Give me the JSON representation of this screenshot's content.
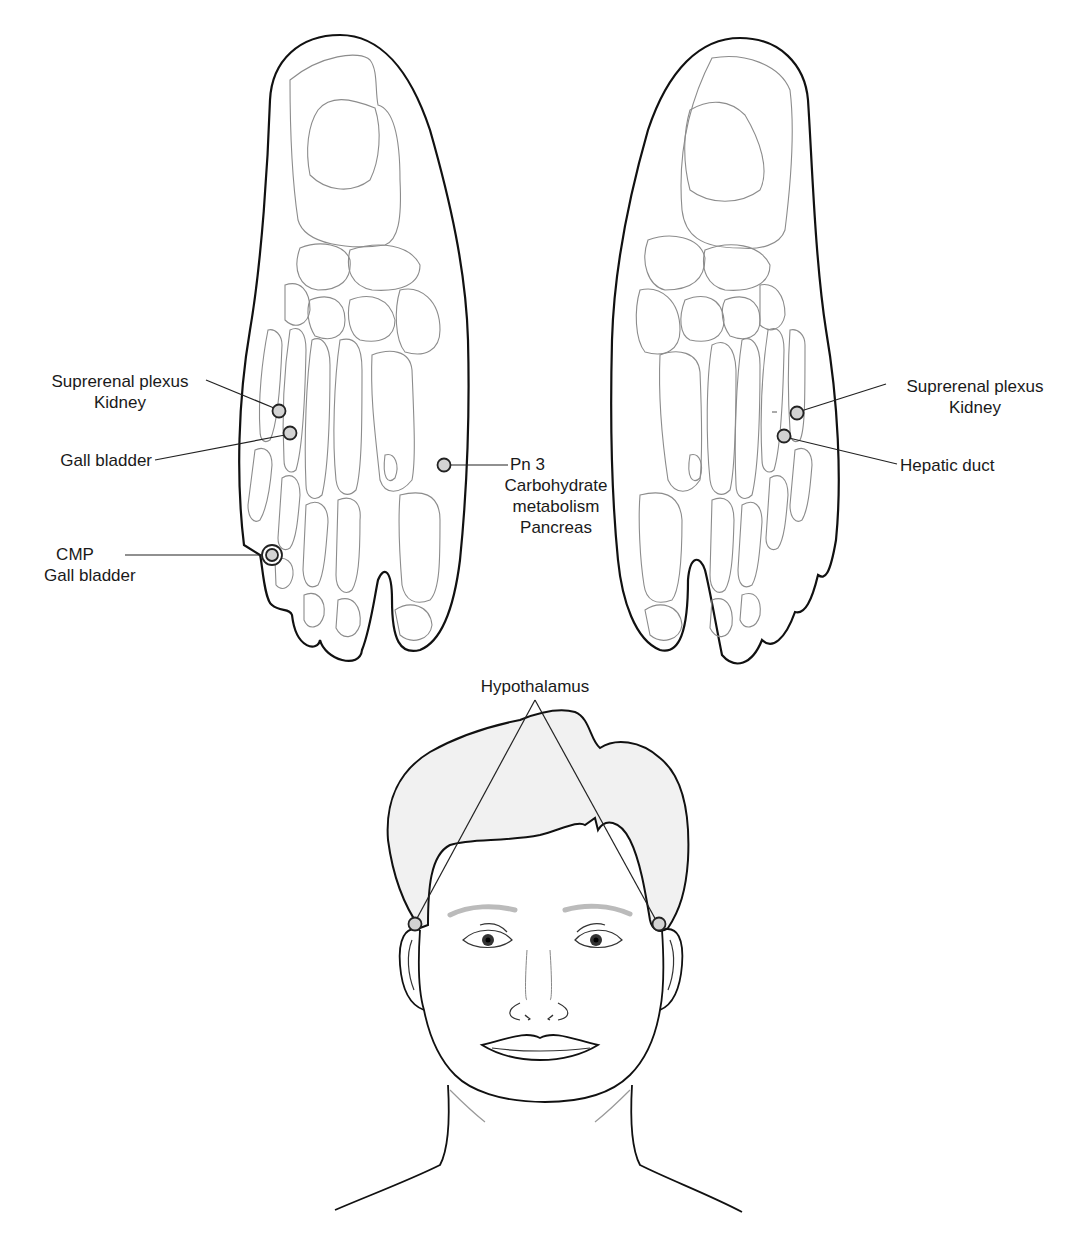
{
  "figure": {
    "left_foot": {
      "labels": [
        {
          "id": "suprerenal-kidney",
          "lines": [
            "Suprerenal plexus",
            "Kidney"
          ]
        },
        {
          "id": "gall-bladder",
          "lines": [
            "Gall bladder"
          ]
        },
        {
          "id": "cmp-gall-bladder",
          "lines": [
            "CMP",
            "Gall bladder"
          ]
        },
        {
          "id": "pn3-pancreas",
          "lines": [
            "Pn 3",
            "Carbohydrate",
            "metabolism",
            "Pancreas"
          ]
        }
      ]
    },
    "right_foot": {
      "labels": [
        {
          "id": "suprerenal-kidney",
          "lines": [
            "Suprerenal plexus",
            "Kidney"
          ]
        },
        {
          "id": "hepatic-duct",
          "lines": [
            "Hepatic duct"
          ]
        }
      ]
    },
    "face": {
      "labels": [
        {
          "id": "hypothalamus",
          "lines": [
            "Hypothalamus"
          ]
        }
      ]
    },
    "colors": {
      "outline": "#111111",
      "bone": "#8c8c8c",
      "point_fill": "#d3d3d3",
      "hair_fill": "#f1f1f1"
    }
  }
}
